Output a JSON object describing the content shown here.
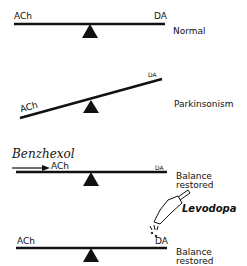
{
  "diagram": {
    "panels": [
      {
        "left_label": "ACh",
        "right_label": "DA",
        "state": "Normal"
      },
      {
        "left_label": "ACh",
        "right_label": "DA",
        "state": "Parkinsonism"
      },
      {
        "left_label": "ACh",
        "right_label": "DA",
        "state_line1": "Balance",
        "state_line2": "restored",
        "drug": "Benzhexol"
      },
      {
        "left_label": "ACh",
        "right_label": "DA",
        "state_line1": "Balance",
        "state_line2": "restored",
        "drug": "Levodopa"
      }
    ]
  }
}
